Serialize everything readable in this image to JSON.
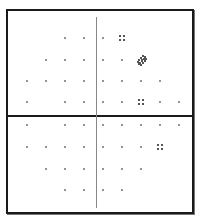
{
  "figure": {
    "colors": {
      "frame": "#1a1a1a",
      "center_line": "#888888",
      "dot": "#707070",
      "cluster": "#555555"
    },
    "columns_x": [
      27,
      46,
      65,
      84,
      103,
      122,
      141,
      160,
      179
    ],
    "rows": [
      {
        "y": 38,
        "dots": [
          65,
          84,
          103
        ],
        "clusters": [
          {
            "x": 122,
            "type": "square-4"
          }
        ]
      },
      {
        "y": 60,
        "dots": [
          46,
          65,
          84,
          103,
          122
        ],
        "clusters": [
          {
            "x": 141,
            "type": "diamond"
          }
        ]
      },
      {
        "y": 81,
        "dots": [
          27,
          46,
          65,
          84,
          103,
          122,
          141,
          160
        ],
        "clusters": []
      },
      {
        "y": 102,
        "dots": [
          27,
          65,
          84,
          103,
          122,
          160,
          179
        ],
        "clusters": [
          {
            "x": 141,
            "type": "square-4"
          }
        ]
      },
      {
        "y": 125,
        "dots": [
          27,
          65,
          84,
          103,
          122,
          141,
          160,
          179
        ],
        "clusters": []
      },
      {
        "y": 147,
        "dots": [
          27,
          46,
          65,
          84,
          103,
          122,
          141
        ],
        "clusters": [
          {
            "x": 160,
            "type": "square-4"
          }
        ]
      },
      {
        "y": 169,
        "dots": [
          46,
          65,
          84,
          103,
          122,
          141
        ],
        "clusters": []
      },
      {
        "y": 190,
        "dots": [
          65,
          84,
          103,
          122
        ],
        "clusters": []
      }
    ]
  }
}
